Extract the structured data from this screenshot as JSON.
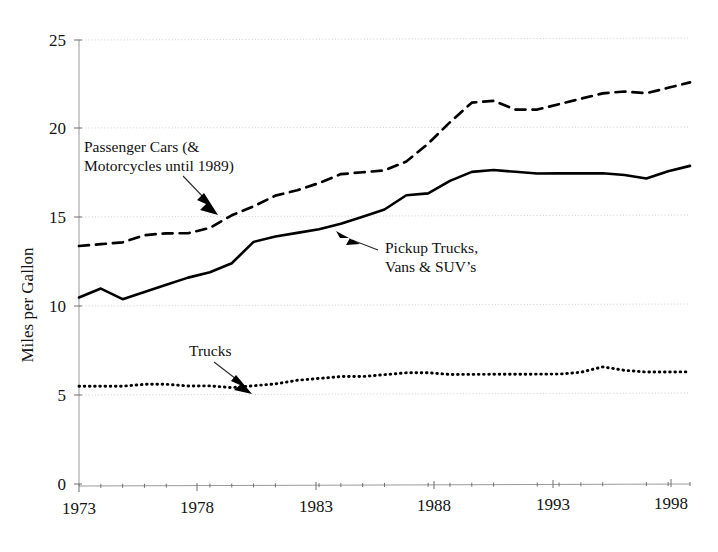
{
  "figure": {
    "background": "#ffffff",
    "ink": "#000000",
    "grid_color": "#c9c9c9",
    "axis_color": "#9a9a9a"
  },
  "axes": {
    "y_title": "Miles per Gallon",
    "y_ticks": [
      "0",
      "5",
      "10",
      "15",
      "20",
      "25"
    ],
    "x_ticks": [
      "1973",
      "1978",
      "1983",
      "1988",
      "1993",
      "1998"
    ]
  },
  "annotations": [
    {
      "id": "passenger-cars",
      "line1": "Passenger Cars (&",
      "line2": "Motorcycles until 1989)"
    },
    {
      "id": "pickup-trucks",
      "line1": "Pickup Trucks,",
      "line2": "Vans & SUV’s"
    },
    {
      "id": "trucks",
      "line1": "Trucks",
      "line2": ""
    }
  ],
  "chart_data": {
    "type": "line",
    "title": "",
    "subtitle": "",
    "xlabel": "",
    "ylabel": "Miles per Gallon",
    "xlim": [
      1973,
      2001
    ],
    "ylim": [
      0,
      25
    ],
    "ytick_values": [
      0,
      5,
      10,
      15,
      20,
      25
    ],
    "xtick_values": [
      1973,
      1978,
      1983,
      1988,
      1993,
      1998
    ],
    "grid": "horizontal-dotted",
    "legend": "inline-annotations",
    "x": [
      1973,
      1974,
      1975,
      1976,
      1977,
      1978,
      1979,
      1980,
      1981,
      1982,
      1983,
      1984,
      1985,
      1986,
      1987,
      1988,
      1989,
      1990,
      1991,
      1992,
      1993,
      1994,
      1995,
      1996,
      1997,
      1998,
      1999,
      2000,
      2001
    ],
    "series": [
      {
        "name": "Passenger Cars (& Motorcycles until 1989)",
        "style": "dashed",
        "values": [
          13.4,
          13.5,
          13.6,
          14.0,
          14.1,
          14.1,
          14.4,
          15.1,
          15.6,
          16.2,
          16.5,
          16.9,
          17.4,
          17.5,
          17.6,
          18.1,
          19.1,
          20.3,
          21.4,
          21.5,
          21.0,
          21.0,
          21.3,
          21.6,
          21.9,
          22.0,
          21.9,
          22.2,
          22.5
        ]
      },
      {
        "name": "Pickup Trucks, Vans & SUV's",
        "style": "solid",
        "values": [
          10.5,
          11.0,
          10.4,
          10.8,
          11.2,
          11.6,
          11.9,
          12.4,
          13.6,
          13.9,
          14.1,
          14.3,
          14.6,
          15.0,
          15.4,
          16.2,
          16.3,
          17.0,
          17.5,
          17.6,
          17.5,
          17.4,
          17.4,
          17.4,
          17.4,
          17.3,
          17.1,
          17.5,
          17.8
        ]
      },
      {
        "name": "Trucks",
        "style": "dotted",
        "values": [
          5.5,
          5.5,
          5.5,
          5.6,
          5.6,
          5.5,
          5.5,
          5.4,
          5.5,
          5.6,
          5.8,
          5.9,
          6.0,
          6.0,
          6.1,
          6.2,
          6.2,
          6.1,
          6.1,
          6.1,
          6.1,
          6.1,
          6.1,
          6.2,
          6.5,
          6.3,
          6.2,
          6.2,
          6.2
        ]
      }
    ]
  }
}
